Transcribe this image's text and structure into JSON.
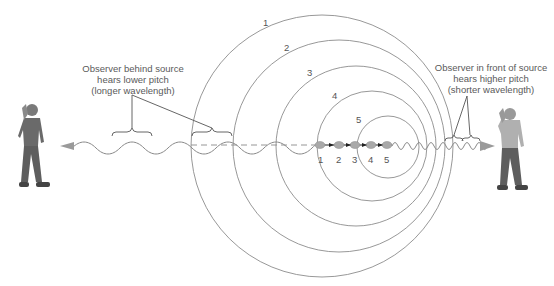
{
  "left_observer": {
    "caption_lines": [
      "Observer behind source",
      "hears lower pitch",
      "(longer wavelength)"
    ]
  },
  "right_observer": {
    "caption_lines": [
      "Observer in front of source",
      "hears higher pitch",
      "(shorter wavelength)"
    ]
  },
  "wavefronts": [
    {
      "label": "1",
      "cx": 322,
      "cy": 146,
      "r": 131
    },
    {
      "label": "2",
      "cx": 339,
      "cy": 146,
      "r": 106
    },
    {
      "label": "3",
      "cx": 356,
      "cy": 146,
      "r": 80
    },
    {
      "label": "4",
      "cx": 372,
      "cy": 146,
      "r": 55
    },
    {
      "label": "5",
      "cx": 388,
      "cy": 147,
      "r": 31
    }
  ],
  "source_positions": [
    {
      "label": "1",
      "x": 320
    },
    {
      "label": "2",
      "x": 339
    },
    {
      "label": "3",
      "x": 355
    },
    {
      "label": "4",
      "x": 371
    },
    {
      "label": "5",
      "x": 387
    }
  ],
  "colors": {
    "line": "#8a8a8a",
    "figure": "#6e6e6e",
    "text": "#555555"
  }
}
